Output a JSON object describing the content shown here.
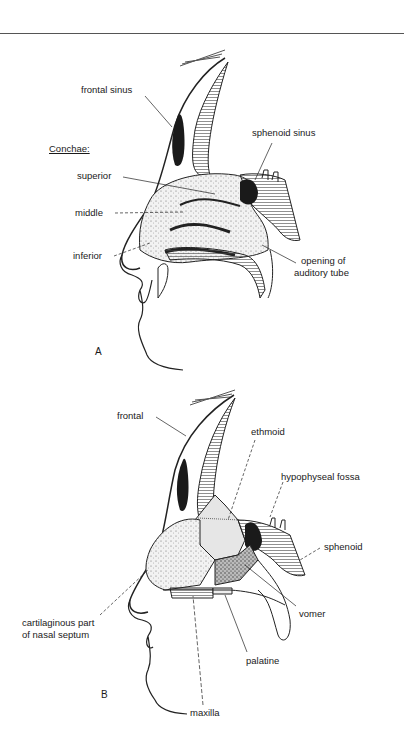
{
  "figure": {
    "panel_a": {
      "panel_label": "A",
      "heading": "Conchae:",
      "labels": {
        "frontal_sinus": "frontal sinus",
        "sphenoid_sinus": "sphenoid sinus",
        "superior": "superior",
        "middle": "middle",
        "inferior": "inferior",
        "opening_line1": "opening of",
        "opening_line2": "auditory tube"
      }
    },
    "panel_b": {
      "panel_label": "B",
      "labels": {
        "frontal": "frontal",
        "ethmoid": "ethmoid",
        "hypophyseal_fossa": "hypophyseal fossa",
        "sphenoid": "sphenoid",
        "cartilaginous_line1": "cartilaginous part",
        "cartilaginous_line2": "of nasal septum",
        "vomer": "vomer",
        "palatine": "palatine",
        "maxilla": "maxilla"
      }
    }
  }
}
